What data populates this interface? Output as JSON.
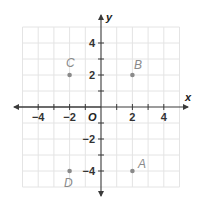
{
  "plane": {
    "x_axis_label": "x",
    "y_axis_label": "y",
    "origin_label": "O",
    "x_tick_labels": [
      "−4",
      "−2",
      "2",
      "4"
    ],
    "y_tick_labels": [
      "4",
      "2",
      "−2",
      "−4"
    ],
    "range": {
      "xmin": -5,
      "xmax": 5,
      "ymin": -5,
      "ymax": 5
    }
  },
  "points": [
    {
      "label": "A",
      "x": 2,
      "y": -4
    },
    {
      "label": "B",
      "x": 2,
      "y": 2
    },
    {
      "label": "C",
      "x": -2,
      "y": 2
    },
    {
      "label": "D",
      "x": -2,
      "y": -4
    }
  ],
  "colors": {
    "grid": "#e4e4e4",
    "axis": "#3a3a3a",
    "point": "#8a8a8a"
  }
}
